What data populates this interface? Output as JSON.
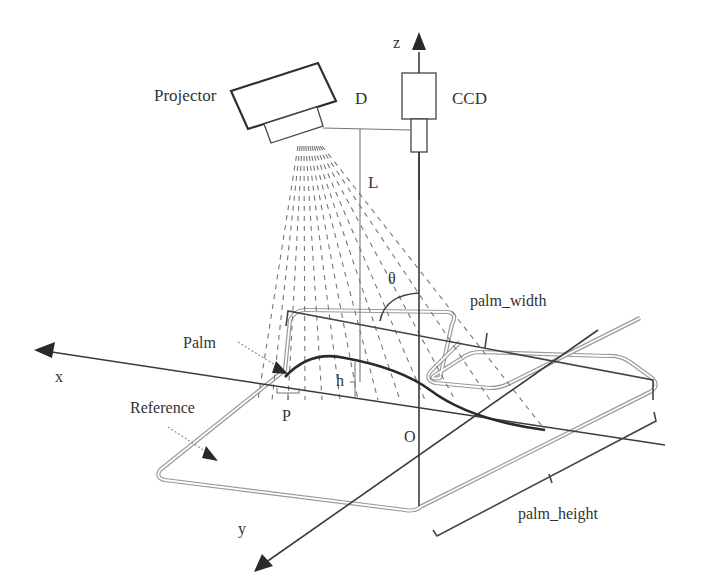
{
  "figure": {
    "labels": {
      "projector": "Projector",
      "ccd": "CCD",
      "z_axis": "z",
      "x_axis": "x",
      "y_axis": "y",
      "baseline_distance": "D",
      "height_distance": "L",
      "angle": "θ",
      "palm_width": "palm_width",
      "palm_height": "palm_height",
      "palm": "Palm",
      "reference": "Reference",
      "point": "P",
      "depth": "h",
      "origin": "O"
    },
    "colors": {
      "line": "#3a3a3a",
      "text": "#333333",
      "reference_outline": "#9a9a9a",
      "rays": "#777777"
    }
  }
}
